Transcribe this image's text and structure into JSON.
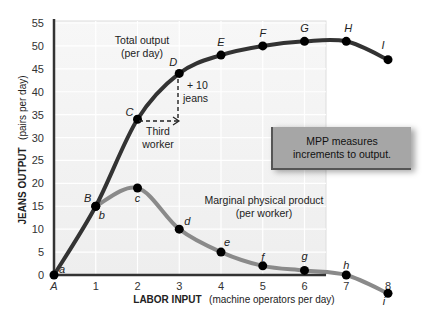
{
  "chart_data": {
    "type": "line",
    "title": "",
    "xlabel_bold": "LABOR INPUT",
    "xlabel_rest": "(machine operators per day)",
    "ylabel_bold": "JEANS OUTPUT",
    "ylabel_rest": "(pairs per day)",
    "x": [
      0,
      1,
      2,
      3,
      4,
      5,
      6,
      7,
      8
    ],
    "x_tick_labels": [
      "A",
      "1",
      "2",
      "3",
      "4",
      "5",
      "6",
      "7",
      "8"
    ],
    "y_ticks": [
      0,
      5,
      10,
      15,
      20,
      25,
      30,
      35,
      40,
      45,
      50,
      55
    ],
    "ylim": [
      0,
      55
    ],
    "xlim": [
      0,
      8
    ],
    "grid": true,
    "series": [
      {
        "name": "Total output (per day)",
        "label_line1": "Total output",
        "label_line2": "(per day)",
        "color": "#333333",
        "values": [
          0,
          15,
          34,
          44,
          48,
          50,
          51,
          51,
          47
        ],
        "point_labels": [
          "A",
          "B",
          "C",
          "D",
          "E",
          "F",
          "G",
          "H",
          "I"
        ]
      },
      {
        "name": "Marginal physical product (per worker)",
        "label_line1": "Marginal physical product",
        "label_line2": "(per worker)",
        "color": "#8a8a8a",
        "values": [
          0,
          15,
          19,
          10,
          5,
          2,
          1,
          0,
          -4
        ],
        "point_labels": [
          "a",
          "b",
          "c",
          "d",
          "e",
          "f",
          "g",
          "h",
          "i"
        ]
      }
    ],
    "annotations": {
      "increment": "+ 10",
      "increment_unit": "jeans",
      "third_worker_line1": "Third",
      "third_worker_line2": "worker",
      "callout_line1": "MPP measures",
      "callout_line2": "increments to output."
    }
  }
}
